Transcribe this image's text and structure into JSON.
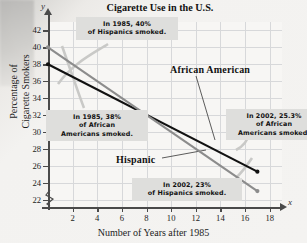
{
  "chart_data": {
    "type": "line",
    "title": "Cigarette Use in the U.S.",
    "xlabel": "Number of Years after 1985",
    "ylabel": "Percentage of Cigarette Smokers",
    "xlim": [
      0,
      19
    ],
    "ylim": [
      21,
      43
    ],
    "xticks": [
      2,
      4,
      6,
      8,
      10,
      12,
      14,
      16,
      18
    ],
    "yticks": [
      22,
      24,
      26,
      28,
      30,
      32,
      34,
      36,
      38,
      40,
      42
    ],
    "grid": true,
    "axis_break_y": true,
    "legend": "inline-labels",
    "series": [
      {
        "name": "African American",
        "color": "#111111",
        "x": [
          0,
          17
        ],
        "values": [
          38,
          25.3
        ]
      },
      {
        "name": "Hispanic",
        "color": "#8c8c8c",
        "x": [
          0,
          17
        ],
        "values": [
          40,
          23
        ]
      }
    ],
    "annotations": [
      {
        "id": "hispanic-1985",
        "lines": [
          "In 1985, 40%",
          "of Hispanics smoked."
        ]
      },
      {
        "id": "african-american-1985",
        "lines": [
          "In 1985, 38%",
          "of African",
          "Americans smoked."
        ]
      },
      {
        "id": "african-american-2002",
        "lines": [
          "In 2002, 25.3%",
          "of African",
          "Americans smoked."
        ]
      },
      {
        "id": "hispanic-2002",
        "lines": [
          "In 2002, 23%",
          "of Hispanics smoked."
        ]
      }
    ],
    "axis_letters": {
      "y": "y",
      "x": "x"
    }
  }
}
